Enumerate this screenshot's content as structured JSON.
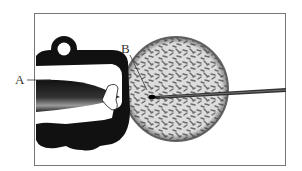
{
  "figure": {
    "labels": [
      {
        "id": "A",
        "text": "A",
        "target": "holding-pipette"
      },
      {
        "id": "B",
        "text": "B",
        "target": "nucleus"
      }
    ],
    "colors": {
      "frame": "#777777",
      "ink": "#111111",
      "cell_fill": "#d9d9d9",
      "cell_texture": "#6a6a6a",
      "label": "#333333"
    }
  }
}
